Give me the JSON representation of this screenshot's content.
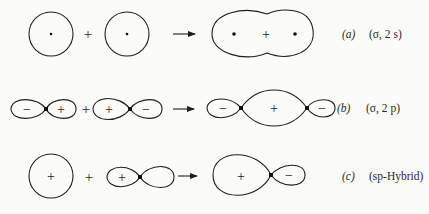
{
  "diagram": {
    "type": "molecular orbital combination",
    "rows": [
      {
        "id": "a",
        "letter": "(a)",
        "description": "(σ, 2 s)",
        "left_operand": {
          "shape": "s-orbital",
          "mark": "nucleus-dot"
        },
        "operator": "+",
        "right_operand": {
          "shape": "s-orbital",
          "mark": "nucleus-dot"
        },
        "arrow": "→",
        "result": {
          "shape": "bonding sigma (peanut)",
          "center_sign": "+",
          "marks": [
            "nucleus-dot",
            "nucleus-dot"
          ]
        }
      },
      {
        "id": "b",
        "letter": "(b)",
        "description": "(σ, 2 p)",
        "left_operand": {
          "shape": "p-orbital",
          "lobe_signs": [
            "−",
            "+"
          ]
        },
        "operator": "+",
        "right_operand": {
          "shape": "p-orbital",
          "lobe_signs": [
            "+",
            "−"
          ]
        },
        "arrow": "→",
        "result": {
          "shape": "sigma 2p",
          "lobe_signs": [
            "−",
            "+",
            "−"
          ]
        }
      },
      {
        "id": "c",
        "letter": "(c)",
        "description": "(sp-Hybrid)",
        "left_operand": {
          "shape": "s-orbital",
          "sign": "+"
        },
        "operator": "+",
        "right_operand": {
          "shape": "p-orbital",
          "lobe_signs": [
            "+",
            ""
          ]
        },
        "arrow": "→",
        "result": {
          "shape": "sp hybrid",
          "lobe_signs": [
            "+",
            "−"
          ]
        }
      }
    ]
  },
  "text": {
    "plus": "+",
    "minus": "−",
    "a_letter": "(a)",
    "a_desc": "(σ, 2 s)",
    "b_letter": "(b)",
    "b_desc": "(σ, 2 p)",
    "c_letter": "(c)",
    "c_desc": "(sp-Hybrid)"
  }
}
